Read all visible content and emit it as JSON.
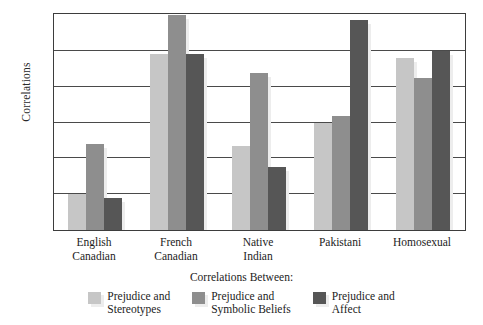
{
  "chart_data": {
    "type": "bar",
    "title": "",
    "xlabel": "Correlations Between:",
    "ylabel": "Correlations",
    "ylim": [
      0,
      0.6
    ],
    "yticks": [
      "0",
      "0.1",
      "0.2",
      "0.3",
      "0.4",
      "0.5",
      "0.6"
    ],
    "ytick_values": [
      0,
      0.1,
      0.2,
      0.3,
      0.4,
      0.5,
      0.6
    ],
    "grid": true,
    "legend_position": "bottom",
    "categories": [
      "English Canadian",
      "French Canadian",
      "Native Indian",
      "Pakistani",
      "Homosexual"
    ],
    "category_lines": [
      [
        "English",
        "Canadian"
      ],
      [
        "French",
        "Canadian"
      ],
      [
        "Native",
        "Indian"
      ],
      [
        "Pakistani"
      ],
      [
        "Homosexual"
      ]
    ],
    "series": [
      {
        "name": "Prejudice and Stereotypes",
        "name_lines": [
          "Prejudice and",
          "Stereotypes"
        ],
        "color": "#c6c6c6",
        "values": [
          0.1,
          0.49,
          0.235,
          0.3,
          0.48
        ]
      },
      {
        "name": "Prejudice and Symbolic Beliefs",
        "name_lines": [
          "Prejudice and",
          "Symbolic Beliefs"
        ],
        "color": "#8e8e8e",
        "values": [
          0.24,
          0.6,
          0.438,
          0.317,
          0.425
        ]
      },
      {
        "name": "Prejudice and Affect",
        "name_lines": [
          "Prejudice and",
          "Affect"
        ],
        "color": "#565656",
        "values": [
          0.09,
          0.49,
          0.175,
          0.585,
          0.5
        ]
      }
    ]
  }
}
